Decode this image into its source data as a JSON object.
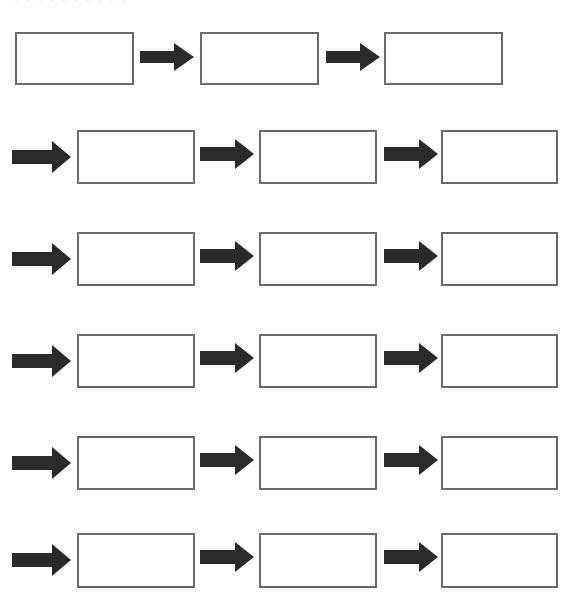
{
  "header": {
    "cutoff_text": "· · · · · · · · · ·"
  },
  "colors": {
    "box_border": "#6b6b6b",
    "arrow_fill": "#2a2a2a",
    "background": "#ffffff"
  },
  "diagram": {
    "rows": [
      {
        "row": 1,
        "leading_arrow": false,
        "boxes": 3
      },
      {
        "row": 2,
        "leading_arrow": true,
        "boxes": 3
      },
      {
        "row": 3,
        "leading_arrow": true,
        "boxes": 3
      },
      {
        "row": 4,
        "leading_arrow": true,
        "boxes": 3
      },
      {
        "row": 5,
        "leading_arrow": true,
        "boxes": 3
      },
      {
        "row": 6,
        "leading_arrow": true,
        "boxes": 3
      }
    ],
    "box_texts": [
      "",
      "",
      "",
      "",
      "",
      "",
      "",
      "",
      "",
      "",
      "",
      "",
      "",
      "",
      "",
      "",
      "",
      ""
    ]
  }
}
